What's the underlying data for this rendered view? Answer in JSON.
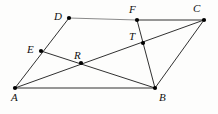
{
  "figure": {
    "width": 218,
    "height": 114,
    "background_color": "#fdfdfc",
    "line_color": "#1a1a1a",
    "light_line_color": "#8a8a8a",
    "point_color": "#000000"
  },
  "points": [
    {
      "id": "A",
      "label": "A",
      "x": 15,
      "y": 88,
      "label_x": 11,
      "label_y": 92
    },
    {
      "id": "B",
      "label": "B",
      "x": 155,
      "y": 88,
      "label_x": 159,
      "label_y": 92
    },
    {
      "id": "C",
      "label": "C",
      "x": 204,
      "y": 20,
      "label_x": 193,
      "label_y": 3
    },
    {
      "id": "D",
      "label": "D",
      "x": 69,
      "y": 18,
      "label_x": 54,
      "label_y": 11
    },
    {
      "id": "E",
      "label": "E",
      "x": 41,
      "y": 51,
      "label_x": 27,
      "label_y": 44
    },
    {
      "id": "F",
      "label": "F",
      "x": 137,
      "y": 20,
      "label_x": 129,
      "label_y": 4
    },
    {
      "id": "R",
      "label": "R",
      "x": 81,
      "y": 63,
      "label_x": 74,
      "label_y": 50
    },
    {
      "id": "T",
      "label": "T",
      "x": 143,
      "y": 43,
      "label_x": 129,
      "label_y": 31
    }
  ],
  "segments": [
    {
      "id": "seg-A-B",
      "name": "segment-ab",
      "from": "A",
      "to": "B",
      "tone": "dark"
    },
    {
      "id": "seg-A-D",
      "name": "segment-ad",
      "from": "A",
      "to": "D",
      "tone": "dark"
    },
    {
      "id": "seg-D-F",
      "name": "segment-df",
      "from": "D",
      "to": "F",
      "tone": "light"
    },
    {
      "id": "seg-F-C",
      "name": "segment-fc",
      "from": "F",
      "to": "C",
      "tone": "dark"
    },
    {
      "id": "seg-B-C",
      "name": "segment-bc",
      "from": "B",
      "to": "C",
      "tone": "dark"
    },
    {
      "id": "seg-A-C",
      "name": "segment-ac",
      "from": "A",
      "to": "C",
      "tone": "dark"
    },
    {
      "id": "seg-E-B",
      "name": "segment-eb",
      "from": "E",
      "to": "B",
      "tone": "dark"
    },
    {
      "id": "seg-F-B",
      "name": "segment-fb",
      "from": "F",
      "to": "B",
      "tone": "dark"
    }
  ]
}
